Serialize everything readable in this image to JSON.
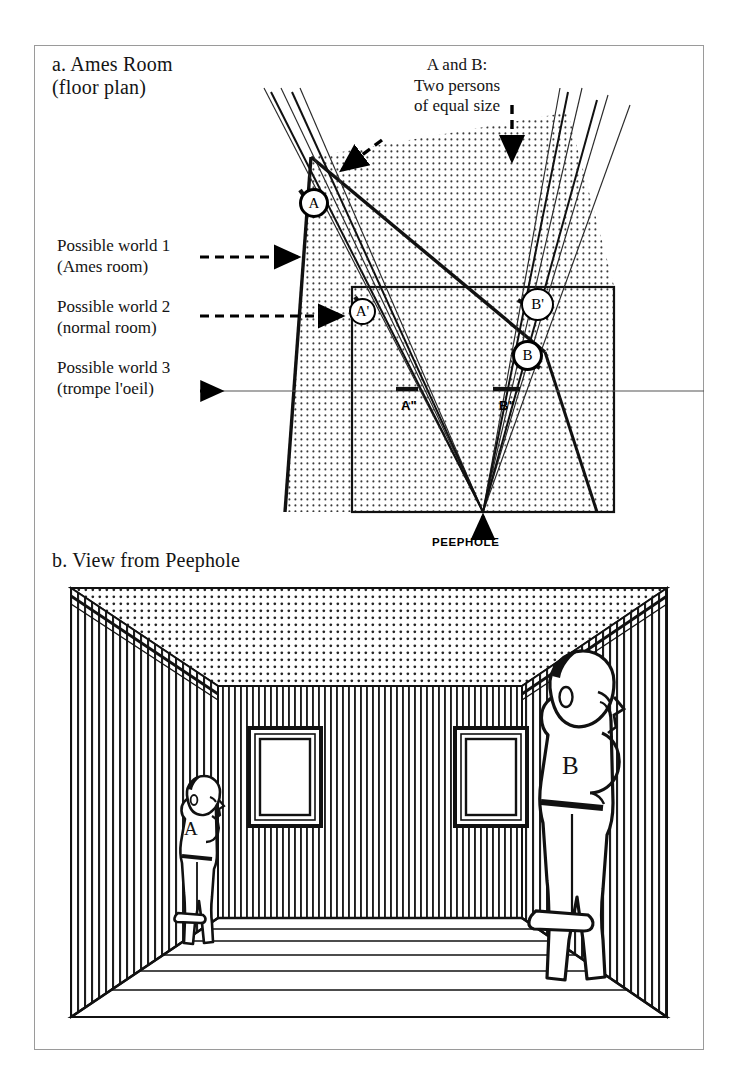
{
  "figure": {
    "panel_a": {
      "title": "a. Ames Room\n(floor plan)",
      "callout": "A and B:\nTwo persons\nof equal size",
      "legend": [
        "Possible world 1\n(Ames room)",
        "Possible world 2\n(normal room)",
        "Possible world 3\n(trompe l'oeil)"
      ],
      "markers": {
        "a_top": "A",
        "a_mid": "A'",
        "b_prime": "B'",
        "b": "B",
        "a_double": "A\"",
        "b_double": "B\""
      },
      "peephole_label": "PEEPHOLE"
    },
    "panel_b": {
      "title": "b. View from Peephole",
      "person_a_label": "A",
      "person_b_label": "B"
    }
  },
  "colors": {
    "ink": "#141414",
    "frame": "#9a9a9a",
    "stipple": "#3a3a3a",
    "paper": "#ffffff",
    "thin_rule": "#555555"
  }
}
